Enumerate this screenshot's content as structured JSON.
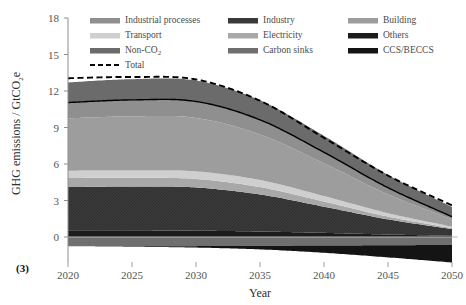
{
  "panel": {
    "tag": "(3)"
  },
  "axes": {
    "x_label": "Year",
    "y_label_main": "GHG emissions / GtCO",
    "y_label_sub": "2",
    "y_label_tail": "e",
    "x_ticks": [
      "2020",
      "2025",
      "2030",
      "2035",
      "2040",
      "2045",
      "2050"
    ],
    "y_ticks": [
      "0",
      "3",
      "6",
      "9",
      "12",
      "15",
      "18"
    ]
  },
  "legend": {
    "entries": [
      {
        "label": "Industrial processes",
        "color": "#8f8f8f"
      },
      {
        "label": "Industry",
        "color": "#3a3a3a"
      },
      {
        "label": "Building",
        "color": "#9d9d9d"
      },
      {
        "label": "Transport",
        "color": "#cfcfcf"
      },
      {
        "label": "Electricity",
        "color": "#a8a8a8"
      },
      {
        "label": "Others",
        "color": "#1c1c1c"
      },
      {
        "label": "Non-CO",
        "sub": "2",
        "color": "#6b6b6b"
      },
      {
        "label": "Carbon sinks",
        "color": "#6f6f6f"
      },
      {
        "label": "CCS/BECCS",
        "color": "#141414"
      },
      {
        "label": "Total",
        "color": "#000000",
        "style": "dashed-line"
      }
    ]
  },
  "chart_data": {
    "type": "area",
    "title": "",
    "xlabel": "Year",
    "ylabel": "GHG emissions / GtCO2e",
    "xlim": [
      2020,
      2050
    ],
    "ylim": [
      -2.2,
      18
    ],
    "grid": false,
    "legend_position": "top",
    "stacked": true,
    "x": [
      2020,
      2025,
      2030,
      2035,
      2040,
      2045,
      2050
    ],
    "series": [
      {
        "name": "Carbon sinks",
        "color": "#6f6f6f",
        "values": [
          -0.75,
          -0.75,
          -0.75,
          -0.72,
          -0.7,
          -0.68,
          -0.65
        ]
      },
      {
        "name": "CCS/BECCS",
        "color": "#141414",
        "values": [
          0.0,
          -0.05,
          -0.12,
          -0.3,
          -0.6,
          -1.0,
          -1.45
        ]
      },
      {
        "name": "Others",
        "color": "#1c1c1c",
        "values": [
          0.55,
          0.55,
          0.52,
          0.45,
          0.34,
          0.2,
          0.1
        ]
      },
      {
        "name": "Industry",
        "color": "#3a3a3a",
        "values": [
          3.55,
          3.6,
          3.55,
          3.05,
          2.15,
          1.25,
          0.55
        ]
      },
      {
        "name": "Electricity",
        "color": "#a8a8a8",
        "values": [
          0.75,
          0.72,
          0.7,
          0.6,
          0.42,
          0.22,
          0.08
        ]
      },
      {
        "name": "Transport",
        "color": "#cfcfcf",
        "values": [
          0.6,
          0.6,
          0.62,
          0.58,
          0.45,
          0.28,
          0.12
        ]
      },
      {
        "name": "Building",
        "color": "#9d9d9d",
        "values": [
          4.3,
          4.45,
          4.4,
          3.75,
          2.7,
          1.55,
          0.6
        ]
      },
      {
        "name": "Industrial processes",
        "color": "#8f8f8f",
        "values": [
          1.3,
          1.35,
          1.35,
          1.2,
          0.9,
          0.55,
          0.22
        ]
      },
      {
        "name": "Non-CO2",
        "color": "#6b6b6b",
        "values": [
          1.65,
          1.7,
          1.72,
          1.6,
          1.35,
          1.05,
          0.8
        ]
      }
    ],
    "total_line": {
      "name": "Total",
      "style": "dashed",
      "color": "#000000",
      "values": [
        13.05,
        13.15,
        12.95,
        11.2,
        8.15,
        5.05,
        2.6
      ]
    }
  }
}
